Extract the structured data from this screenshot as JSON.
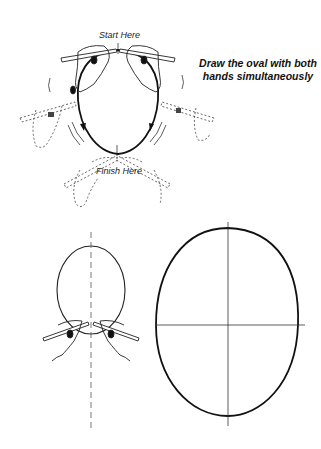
{
  "labels": {
    "start": "Start Here",
    "finish": "Finish Here",
    "instruction_line1": "Draw the oval with both",
    "instruction_line2": "hands simultaneously"
  },
  "colors": {
    "ink": "#111111",
    "sketch": "#555555",
    "background": "#ffffff"
  }
}
